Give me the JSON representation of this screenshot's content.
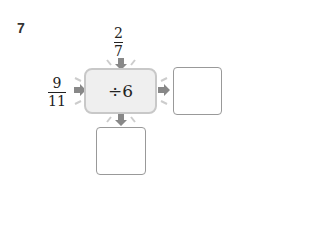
{
  "problem": {
    "number": "7"
  },
  "inputs": {
    "top": {
      "numerator": "2",
      "denominator": "7"
    },
    "left": {
      "numerator": "9",
      "denominator": "11"
    }
  },
  "operation": {
    "label": "÷6"
  },
  "outputs": {
    "right": "",
    "bottom": ""
  }
}
